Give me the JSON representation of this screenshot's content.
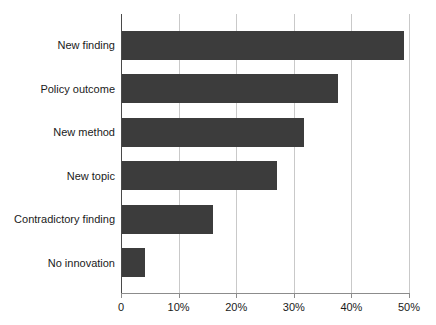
{
  "chart_data": {
    "type": "bar",
    "orientation": "horizontal",
    "title": "",
    "subtitle": "",
    "xlabel": "",
    "ylabel": "",
    "categories": [
      "New finding",
      "Policy outcome",
      "New method",
      "New topic",
      "Contradictory finding",
      "No innovation"
    ],
    "values": [
      49.0,
      37.5,
      31.6,
      26.9,
      15.8,
      4.0
    ],
    "series": [
      {
        "name": "Share of responses",
        "values": [
          49.0,
          37.5,
          31.6,
          26.9,
          15.8,
          4.0
        ]
      }
    ],
    "xlim": [
      0,
      50
    ],
    "xticks": [
      0,
      10,
      20,
      30,
      40,
      50
    ],
    "xtick_labels": [
      "0",
      "10%",
      "20%",
      "30%",
      "40%",
      "50%"
    ],
    "grid": "vertical",
    "legend": "none",
    "bar_color": "#3c3c3c",
    "gridline_color": "#c9c9c9",
    "axis_color": "#8c8c8c",
    "text_color": "#1a1a1a",
    "background_color": "#ffffff"
  }
}
